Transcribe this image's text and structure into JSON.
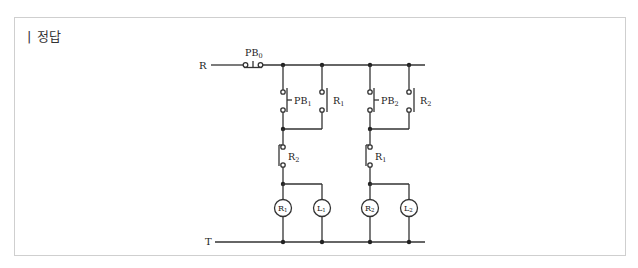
{
  "header": {
    "title": "| 정답"
  },
  "diagram": {
    "type": "relay-sequence-circuit",
    "supply_lines": {
      "top": "R",
      "bottom": "T"
    },
    "top_switch": {
      "label": "PB",
      "sub": "0",
      "type": "push-button-NC"
    },
    "branches": [
      {
        "start_switch": {
          "label": "PB",
          "sub": "1",
          "type": "push-button-NO"
        },
        "holding_contact": {
          "label": "R",
          "sub": "1",
          "type": "relay-contact-NO"
        },
        "interlock_contact": {
          "label": "R",
          "sub": "2",
          "type": "relay-contact-NC"
        },
        "relay_coil": {
          "label": "R",
          "sub": "1"
        },
        "lamp": {
          "label": "L",
          "sub": "1"
        }
      },
      {
        "start_switch": {
          "label": "PB",
          "sub": "2",
          "type": "push-button-NO"
        },
        "holding_contact": {
          "label": "R",
          "sub": "2",
          "type": "relay-contact-NO"
        },
        "interlock_contact": {
          "label": "R",
          "sub": "1",
          "type": "relay-contact-NC"
        },
        "relay_coil": {
          "label": "R",
          "sub": "2"
        },
        "lamp": {
          "label": "L",
          "sub": "2"
        }
      }
    ],
    "colors": {
      "line": "#333333",
      "frame": "#cfcfcf",
      "text": "#222222"
    }
  }
}
